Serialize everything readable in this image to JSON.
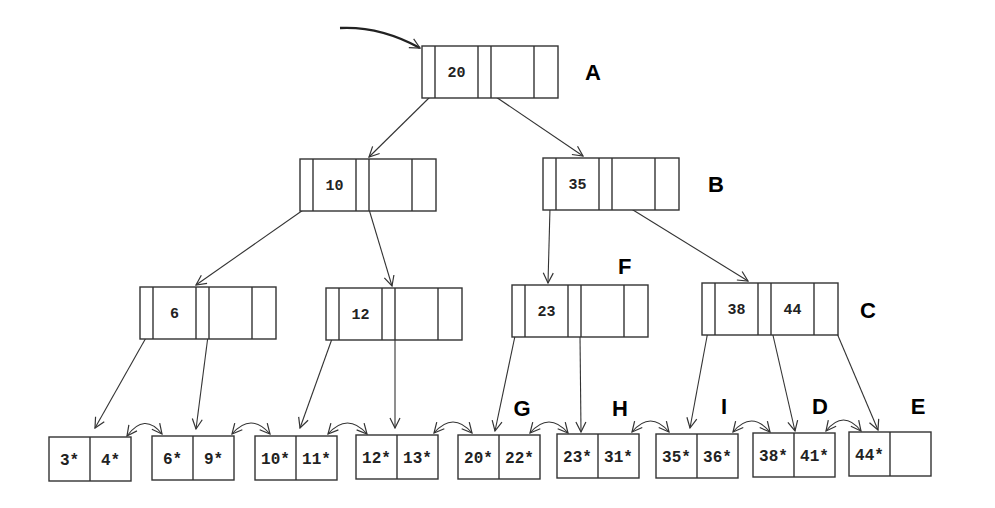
{
  "diagram": {
    "colors": {
      "stroke": "#333333",
      "background": "#ffffff",
      "text": "#222222"
    },
    "inner_nodes": [
      {
        "id": "A",
        "label": "A",
        "keys": [
          "20",
          ""
        ],
        "x": 422,
        "y": 46,
        "w": 136,
        "h": 52,
        "label_x": 585,
        "label_y": 80
      },
      {
        "id": "n10",
        "label": "",
        "keys": [
          "10",
          ""
        ],
        "x": 300,
        "y": 159,
        "w": 136,
        "h": 52
      },
      {
        "id": "B",
        "label": "B",
        "keys": [
          "35",
          ""
        ],
        "x": 543,
        "y": 158,
        "w": 136,
        "h": 52,
        "label_x": 708,
        "label_y": 192
      },
      {
        "id": "n6",
        "label": "",
        "keys": [
          "6",
          ""
        ],
        "x": 140,
        "y": 287,
        "w": 136,
        "h": 52
      },
      {
        "id": "n12",
        "label": "",
        "keys": [
          "12",
          ""
        ],
        "x": 326,
        "y": 288,
        "w": 136,
        "h": 52
      },
      {
        "id": "F",
        "label": "F",
        "keys": [
          "23",
          ""
        ],
        "x": 512,
        "y": 285,
        "w": 136,
        "h": 52,
        "label_x": 618,
        "label_y": 274
      },
      {
        "id": "C",
        "label": "C",
        "keys": [
          "38",
          "44"
        ],
        "x": 702,
        "y": 283,
        "w": 136,
        "h": 52,
        "label_x": 860,
        "label_y": 318
      }
    ],
    "leaf_nodes": [
      {
        "id": "L1",
        "label": "",
        "entries": [
          "3*",
          "4*"
        ],
        "x": 49,
        "y": 437
      },
      {
        "id": "L2",
        "label": "",
        "entries": [
          "6*",
          "9*"
        ],
        "x": 152,
        "y": 436
      },
      {
        "id": "L3",
        "label": "",
        "entries": [
          "10*",
          "11*"
        ],
        "x": 255,
        "y": 436
      },
      {
        "id": "L4",
        "label": "",
        "entries": [
          "12*",
          "13*"
        ],
        "x": 356,
        "y": 435
      },
      {
        "id": "G",
        "label": "G",
        "entries": [
          "20*",
          "22*"
        ],
        "x": 458,
        "y": 435,
        "label_x": 522,
        "label_y": 416
      },
      {
        "id": "H",
        "label": "H",
        "entries": [
          "23*",
          "31*"
        ],
        "x": 557,
        "y": 434,
        "label_x": 620,
        "label_y": 416
      },
      {
        "id": "I",
        "label": "I",
        "entries": [
          "35*",
          "36*"
        ],
        "x": 656,
        "y": 434,
        "label_x": 724,
        "label_y": 414
      },
      {
        "id": "D",
        "label": "D",
        "entries": [
          "38*",
          "41*"
        ],
        "x": 753,
        "y": 433,
        "label_x": 820,
        "label_y": 414
      },
      {
        "id": "E",
        "label": "E",
        "entries": [
          "44*",
          ""
        ],
        "x": 849,
        "y": 432,
        "label_x": 918,
        "label_y": 414
      }
    ],
    "leaf_size": {
      "w": 82,
      "h": 44
    },
    "edges": [
      {
        "from": [
          432,
          95
        ],
        "to": [
          369,
          157
        ]
      },
      {
        "from": [
          493,
          95
        ],
        "to": [
          583,
          156
        ]
      },
      {
        "from": [
          306,
          208
        ],
        "to": [
          196,
          285
        ]
      },
      {
        "from": [
          368,
          206
        ],
        "to": [
          392,
          286
        ]
      },
      {
        "from": [
          550,
          208
        ],
        "to": [
          548,
          283
        ]
      },
      {
        "from": [
          612,
          197
        ],
        "to": [
          748,
          281
        ]
      },
      {
        "from": [
          147,
          336
        ],
        "to": [
          95,
          428
        ]
      },
      {
        "from": [
          208,
          336
        ],
        "to": [
          196,
          429
        ]
      },
      {
        "from": [
          333,
          336
        ],
        "to": [
          300,
          428
        ]
      },
      {
        "from": [
          395,
          336
        ],
        "to": [
          395,
          428
        ]
      },
      {
        "from": [
          515,
          336
        ],
        "to": [
          495,
          431
        ]
      },
      {
        "from": [
          580,
          336
        ],
        "to": [
          581,
          432
        ]
      },
      {
        "from": [
          708,
          331
        ],
        "to": [
          690,
          428
        ]
      },
      {
        "from": [
          772,
          331
        ],
        "to": [
          795,
          431
        ]
      },
      {
        "from": [
          836,
          331
        ],
        "to": [
          878,
          430
        ]
      }
    ],
    "sibling_links": [
      {
        "from": [
          127,
          436
        ],
        "to": [
          162,
          434
        ]
      },
      {
        "from": [
          232,
          434
        ],
        "to": [
          270,
          434
        ]
      },
      {
        "from": [
          328,
          434
        ],
        "to": [
          367,
          434
        ]
      },
      {
        "from": [
          434,
          433
        ],
        "to": [
          472,
          433
        ]
      },
      {
        "from": [
          530,
          433
        ],
        "to": [
          568,
          433
        ]
      },
      {
        "from": [
          632,
          432
        ],
        "to": [
          669,
          432
        ]
      },
      {
        "from": [
          733,
          432
        ],
        "to": [
          770,
          432
        ]
      },
      {
        "from": [
          826,
          431
        ],
        "to": [
          861,
          431
        ]
      }
    ],
    "root_pointer": {
      "from": [
        340,
        28
      ],
      "to": [
        420,
        48
      ]
    }
  }
}
